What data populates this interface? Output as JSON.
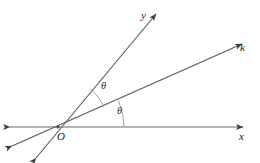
{
  "figure": {
    "kind": "geometry-diagram",
    "width": 260,
    "height": 163,
    "background_color": "#ffffff",
    "stroke_color": "#4a4a4a",
    "arc_color": "#8a8a8a",
    "text_color": "#1a1a1a"
  },
  "labels": {
    "y_axis": "y",
    "k_ray": "k",
    "x_axis": "x",
    "origin": "O",
    "angle_upper": "θ",
    "angle_lower": "θ"
  },
  "geometry": {
    "origin": {
      "x": 58,
      "y": 127
    },
    "lines": [
      {
        "name": "x-axis",
        "from": {
          "x": 10,
          "y": 127
        },
        "to": {
          "x": 243,
          "y": 127
        },
        "arrow_start": true,
        "arrow_end": true
      },
      {
        "name": "line-y",
        "from": {
          "x": 36,
          "y": 158
        },
        "to": {
          "x": 156,
          "y": 14
        },
        "arrow_start": true,
        "arrow_end": true
      },
      {
        "name": "line-k",
        "from": {
          "x": 12,
          "y": 146
        },
        "to": {
          "x": 242,
          "y": 44
        },
        "arrow_start": true,
        "arrow_end": true
      }
    ],
    "arcs": [
      {
        "name": "angle-arc-lower",
        "radius": 66,
        "from_deg": 0,
        "to_deg": 24
      },
      {
        "name": "angle-arc-upper",
        "radius": 50,
        "from_deg": 24,
        "to_deg": 50
      }
    ]
  },
  "label_positions": {
    "y_axis": {
      "x": 141,
      "y": 10
    },
    "k_ray": {
      "x": 240,
      "y": 42
    },
    "x_axis": {
      "x": 239,
      "y": 131
    },
    "origin": {
      "x": 57,
      "y": 131
    },
    "angle_upper": {
      "x": 101,
      "y": 81
    },
    "angle_lower": {
      "x": 117,
      "y": 106
    }
  }
}
